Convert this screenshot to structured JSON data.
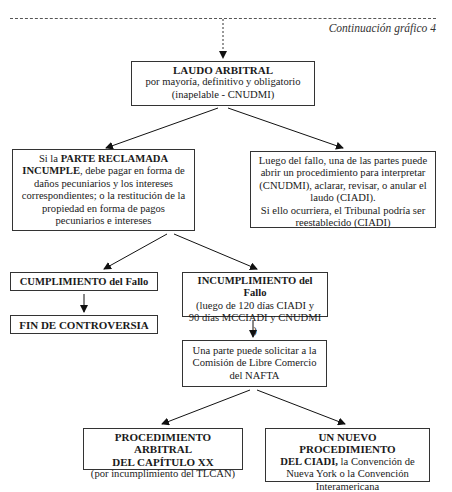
{
  "header": {
    "caption": "Continuación gráfico 4"
  },
  "nodes": {
    "laudo": {
      "title": "LAUDO ARBITRAL",
      "line1": "por mayoría, definitivo y obligatorio",
      "line2": "(inapelable - CNUDMI)"
    },
    "parte_reclamada": {
      "pre": "Si la ",
      "bold": "PARTE RECLAMADA INCUMPLE",
      "post": ", debe pagar en forma de daños pecuniarios y los intereses correspondientes; o la restitución de la propiedad en forma de pagos pecuniarios e intereses"
    },
    "luego_fallo": {
      "text": "Luego del fallo, una de las partes puede abrir un procedimiento para interpretar (CNUDMI), aclarar, revisar, o anular el laudo (CIADI).",
      "text2": "Si ello ocurriera, el Tribunal podría ser reestablecido (CIADI)"
    },
    "cumplimiento": {
      "bold": "CUMPLIMIENTO",
      "rest": " del Fallo"
    },
    "fin": {
      "title": "FIN DE CONTROVERSIA"
    },
    "incumplimiento": {
      "bold": "INCUMPLIMIENTO",
      "rest": " del Fallo",
      "line1": "(luego de 120 días CIADI y",
      "line2": "90 días MCCIADI y CNUDMI )"
    },
    "comision": {
      "text": "Una parte puede solicitar a la Comisión de Libre Comercio del NAFTA"
    },
    "capitulo_xx": {
      "title1": "PROCEDIMIENTO ARBITRAL",
      "title2": "DEL CAPÍTULO XX",
      "line": "(por incumplimiento del TLCAN)"
    },
    "nuevo_ciadi": {
      "bold1": "UN NUEVO PROCEDIMIENTO",
      "bold2": "DEL CIADI,",
      "rest": " la Convención de Nueva York o la Convención Interamericana"
    }
  }
}
